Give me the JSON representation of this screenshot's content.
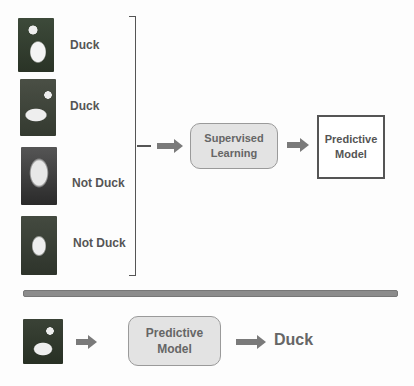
{
  "training": {
    "examples": [
      {
        "image": "white-duck-photo",
        "label": "Duck"
      },
      {
        "image": "walking-duck-photo",
        "label": "Duck"
      },
      {
        "image": "eagle-photo",
        "label": "Not Duck"
      },
      {
        "image": "chicken-photo",
        "label": "Not Duck"
      }
    ],
    "process_box": {
      "line1": "Supervised",
      "line2": "Learning"
    },
    "output_box": {
      "line1": "Predictive",
      "line2": "Model"
    }
  },
  "prediction": {
    "input_image": "duck-photo",
    "model_box": {
      "line1": "Predictive",
      "line2": "Model"
    },
    "output_label": "Duck"
  },
  "colors": {
    "arrow": "#7a7a7a",
    "box_fill": "#e3e3e3",
    "divider": "#8c8c8c"
  }
}
